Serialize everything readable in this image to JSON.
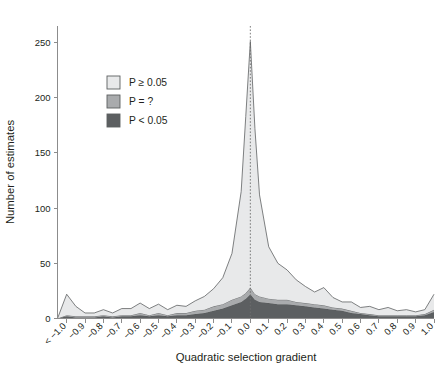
{
  "chart_data": {
    "type": "area",
    "stacked": true,
    "title": "",
    "xlabel": "Quadratic selection gradient",
    "ylabel": "Number of estimates",
    "xlim": [
      -1.05,
      1.0
    ],
    "ylim": [
      0,
      265
    ],
    "grid": false,
    "legend_position": "upper-left-inside",
    "reference_line": {
      "x": 0.0,
      "style": "dotted",
      "label": ""
    },
    "x_tick_labels": [
      "< −1.0",
      "−0.9",
      "−0.8",
      "−0.7",
      "−0.6",
      "−0.5",
      "−0.4",
      "−0.3",
      "−0.2",
      "−0.1",
      "0.0",
      "0.1",
      "0.2",
      "0.3",
      "0.4",
      "0.5",
      "0.6",
      "0.7",
      "0.8",
      "0.9",
      "1.0"
    ],
    "y_tick_labels": [
      "0",
      "50",
      "100",
      "150",
      "200",
      "250"
    ],
    "y_ticks": [
      0,
      50,
      100,
      150,
      200,
      250
    ],
    "x": [
      -1.05,
      -1.0,
      -0.95,
      -0.9,
      -0.85,
      -0.8,
      -0.75,
      -0.7,
      -0.65,
      -0.6,
      -0.55,
      -0.5,
      -0.45,
      -0.4,
      -0.35,
      -0.3,
      -0.25,
      -0.2,
      -0.15,
      -0.1,
      -0.05,
      -0.025,
      0.0,
      0.025,
      0.05,
      0.1,
      0.15,
      0.2,
      0.25,
      0.3,
      0.35,
      0.4,
      0.45,
      0.5,
      0.55,
      0.6,
      0.65,
      0.7,
      0.75,
      0.8,
      0.85,
      0.9,
      0.95,
      1.0
    ],
    "series": [
      {
        "name": "P < 0.05",
        "color": "#5c5f61",
        "values": [
          0,
          2,
          1,
          1,
          1,
          2,
          1,
          2,
          2,
          3,
          2,
          3,
          2,
          3,
          3,
          4,
          5,
          7,
          9,
          12,
          15,
          18,
          22,
          17,
          15,
          14,
          13,
          13,
          12,
          11,
          10,
          9,
          8,
          7,
          5,
          4,
          3,
          2,
          2,
          2,
          2,
          2,
          3,
          6
        ]
      },
      {
        "name": "P = ?",
        "color": "#a9abad",
        "values": [
          0,
          1,
          1,
          1,
          1,
          1,
          1,
          1,
          1,
          2,
          1,
          2,
          1,
          2,
          2,
          3,
          3,
          4,
          4,
          5,
          5,
          5,
          6,
          5,
          5,
          4,
          4,
          4,
          3,
          3,
          3,
          3,
          2,
          2,
          2,
          1,
          1,
          1,
          1,
          1,
          1,
          1,
          1,
          2
        ]
      },
      {
        "name": "P ≥ 0.05",
        "color": "#e8e9ea",
        "values": [
          0,
          19,
          9,
          3,
          3,
          5,
          3,
          6,
          6,
          9,
          6,
          8,
          5,
          7,
          6,
          9,
          12,
          16,
          24,
          42,
          95,
          160,
          223,
          150,
          92,
          47,
          33,
          27,
          20,
          15,
          11,
          16,
          9,
          6,
          8,
          5,
          7,
          5,
          7,
          4,
          5,
          3,
          4,
          14
        ]
      }
    ],
    "totals_note": "values are stacked: P<0.05 bottom, P=? middle, P≥0.05 top; peak total ≈ 251 at x = 0.0"
  },
  "legend": {
    "items": [
      {
        "label": "P ≥ 0.05",
        "color": "#e8e9ea",
        "swatch": "legend-swatch-light"
      },
      {
        "label": "P = ?",
        "color": "#a9abad",
        "swatch": "legend-swatch-medium"
      },
      {
        "label": "P < 0.05",
        "color": "#5c5f61",
        "swatch": "legend-swatch-dark"
      }
    ]
  },
  "axes": {
    "x_title": "Quadratic selection gradient",
    "y_title": "Number of estimates"
  }
}
